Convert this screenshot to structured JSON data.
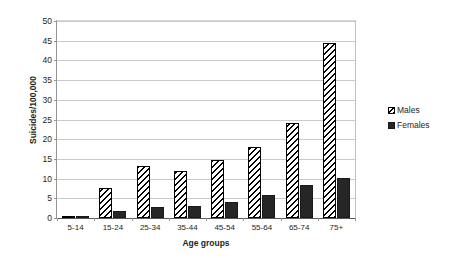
{
  "chart_data": {
    "type": "bar",
    "title": "",
    "xlabel": "Age groups",
    "ylabel": "Suicides/100,000",
    "categories": [
      "5-14",
      "15-24",
      "25-34",
      "35-44",
      "45-54",
      "55-64",
      "65-74",
      "75+"
    ],
    "series": [
      {
        "name": "Males",
        "values": [
          0.5,
          7.6,
          13.3,
          11.9,
          14.8,
          18.0,
          24.1,
          44.5
        ]
      },
      {
        "name": "Females",
        "values": [
          0.3,
          1.9,
          2.7,
          3.1,
          4.0,
          5.8,
          8.4,
          10.1
        ]
      }
    ],
    "ylim": [
      0,
      50
    ],
    "yticks": [
      0,
      5,
      10,
      15,
      20,
      25,
      30,
      35,
      40,
      45,
      50
    ],
    "ytick_labels": [
      "0",
      "5",
      "10",
      "15",
      "20",
      "25",
      "30",
      "35",
      "40",
      "45",
      "50"
    ],
    "grid": true,
    "legend_position": "right",
    "colors": {
      "males": "#ffffff",
      "males_pattern": "#000000",
      "females": "#262626",
      "gridline": "#c9cacc",
      "axis": "#58595b",
      "text": "#231f20",
      "background": "#ffffff"
    }
  },
  "legend": {
    "entries": [
      {
        "label": "Males",
        "swatch": "hatched-swatch"
      },
      {
        "label": "Females",
        "swatch": "solid-swatch"
      }
    ]
  }
}
